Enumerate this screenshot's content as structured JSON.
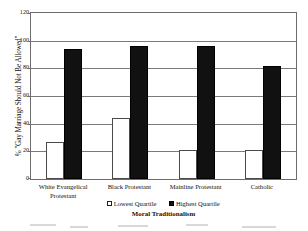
{
  "chart_data": {
    "type": "bar",
    "title": "",
    "subtitle": "",
    "xlabel": "Moral Traditionalism",
    "ylabel": "% \"Gay Marriage Should Not Be Allowed\"",
    "categories": [
      "White Evangelical Protestant",
      "Black Protestant",
      "Mainline Protestant",
      "Catholic"
    ],
    "category_lines": [
      [
        "White Evangelical",
        "Protestant"
      ],
      [
        "Black Protestant"
      ],
      [
        "Mainline Protestant"
      ],
      [
        "Catholic"
      ]
    ],
    "series": [
      {
        "name": "Lowest Quartile",
        "color": "#ffffff",
        "values": [
          27,
          44,
          21,
          21
        ]
      },
      {
        "name": "Highest Quartile",
        "color": "#111111",
        "values": [
          94,
          96,
          96,
          82
        ]
      }
    ],
    "ylim": [
      0,
      120
    ],
    "ytick_values": [
      0,
      20,
      40,
      60,
      80,
      100,
      120
    ],
    "ytick_labels": [
      "0",
      "20",
      "40",
      "60",
      "80",
      "100",
      "120"
    ],
    "grid": true,
    "grid_axis": "y",
    "legend_position": "bottom",
    "legend": [
      {
        "label": "Lowest Quartile",
        "marker": "open-square"
      },
      {
        "label": "Highest Quartile",
        "marker": "filled-square"
      }
    ]
  }
}
